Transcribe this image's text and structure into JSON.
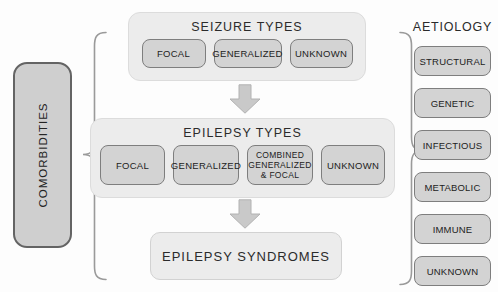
{
  "figure": {
    "comorbidities_label": "COMORBIDITIES",
    "seizure_types": {
      "title": "SEIZURE TYPES",
      "items": [
        "FOCAL",
        "GENERALIZED",
        "UNKNOWN"
      ]
    },
    "epilepsy_types": {
      "title": "EPILEPSY TYPES",
      "items": [
        "FOCAL",
        "GENERALIZED",
        "COMBINED\nGENERALIZED\n& FOCAL",
        "UNKNOWN"
      ]
    },
    "epilepsy_syndromes_label": "EPILEPSY SYNDROMES",
    "aetiology": {
      "title": "AETIOLOGY",
      "items": [
        "STRUCTURAL",
        "GENETIC",
        "INFECTIOUS",
        "METABOLIC",
        "IMMUNE",
        "UNKNOWN"
      ]
    },
    "colors": {
      "container_fill": "#ececec",
      "box_fill": "#d3d3d3",
      "box_border": "#7e7e7e",
      "comorbidities_fill": "#cfcfcf",
      "comorbidities_border": "#646464",
      "arrow_fill": "#c9c9c9",
      "brace_stroke": "#9a9a9a",
      "text": "#262626"
    }
  }
}
